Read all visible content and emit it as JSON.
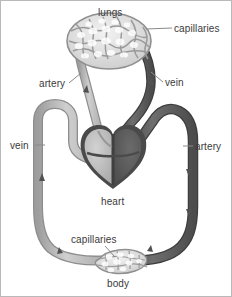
{
  "figure": {
    "background": "#ffffff",
    "border_color": "#b9b9b9"
  },
  "labels": {
    "lungs": "lungs",
    "capillaries_top": "capillaries",
    "artery_pulmonary": "artery",
    "vein_pulmonary": "vein",
    "vein_systemic": "vein",
    "artery_systemic": "artery",
    "heart": "heart",
    "capillaries_bottom": "capillaries",
    "body": "body"
  },
  "colors": {
    "vessel_light": "#b6b6b6",
    "vessel_light_edge": "#8d8d8d",
    "vessel_dark": "#595959",
    "vessel_dark_edge": "#3d3d3d",
    "heart_light": "#bdbdbd",
    "heart_dark": "#5c5c5c",
    "heart_outline": "#4a4a4a",
    "capillary_mesh": "#9a9a9a",
    "text": "#3a3a3a",
    "leader_line": "#8a8a8a"
  },
  "diagram_parts": [
    {
      "name": "lungs-capillary-bed",
      "shape": "oval-mesh",
      "position": "top-center"
    },
    {
      "name": "pulmonary-artery",
      "tone": "light",
      "flow": "heart-to-lungs"
    },
    {
      "name": "pulmonary-vein",
      "tone": "dark",
      "flow": "lungs-to-heart"
    },
    {
      "name": "heart",
      "tone": "two-tone",
      "position": "center"
    },
    {
      "name": "systemic-artery",
      "tone": "dark",
      "flow": "heart-to-body",
      "side": "right"
    },
    {
      "name": "systemic-vein",
      "tone": "light",
      "flow": "body-to-heart",
      "side": "left"
    },
    {
      "name": "body-capillary-bed",
      "shape": "lens-mesh",
      "position": "bottom-center"
    }
  ],
  "flow_arrows": [
    {
      "on": "pulmonary-artery",
      "direction": "up"
    },
    {
      "on": "pulmonary-vein",
      "direction": "down"
    },
    {
      "on": "systemic-artery",
      "direction": "down"
    },
    {
      "on": "systemic-vein",
      "direction": "up"
    }
  ]
}
